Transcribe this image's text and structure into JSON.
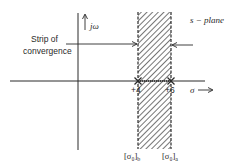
{
  "diagram": {
    "title": "s − plane",
    "axes": {
      "vertical_label": "jω",
      "horizontal_label": "σ"
    },
    "annotation": {
      "line1": "Strip of",
      "line2": "convergence"
    },
    "points": [
      {
        "label": "+4",
        "value": 4,
        "marker": "x"
      },
      {
        "label": "+6",
        "value": 6,
        "marker": "x"
      }
    ],
    "boundaries": [
      {
        "label_main": "[σ₀]",
        "label_sub": "b"
      },
      {
        "label_main": "[σ₀]",
        "label_sub": "a"
      }
    ],
    "colors": {
      "ink": "#2a2a2a",
      "background": "#ffffff"
    }
  }
}
